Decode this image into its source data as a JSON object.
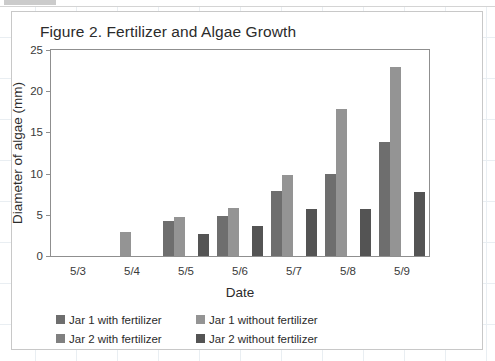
{
  "chart_data": {
    "type": "bar",
    "title": "Figure 2. Fertilizer and Algae Growth",
    "xlabel": "Date",
    "ylabel": "Diameter of algae (mm)",
    "categories": [
      "5/3",
      "5/4",
      "5/5",
      "5/6",
      "5/7",
      "5/8",
      "5/9"
    ],
    "ylim": [
      0,
      25
    ],
    "yticks": [
      0,
      5,
      10,
      15,
      20,
      25
    ],
    "grid": false,
    "legend_position": "bottom-left",
    "series": [
      {
        "name": "Jar 1 with fertilizer",
        "color": "#6e6e6e",
        "values": [
          0,
          0,
          4.3,
          4.8,
          7.9,
          9.9,
          13.8
        ]
      },
      {
        "name": "Jar 1 without fertilizer",
        "color": "#949494",
        "values": [
          0,
          2.9,
          4.7,
          5.8,
          9.8,
          17.8,
          22.9
        ]
      },
      {
        "name": "Jar 2 with fertilizer",
        "color": "#808080",
        "values": [
          0,
          0,
          0,
          0,
          0,
          0,
          0
        ]
      },
      {
        "name": "Jar 2 without fertilizer",
        "color": "#545454",
        "values": [
          0,
          0,
          2.7,
          3.7,
          5.7,
          5.7,
          7.8
        ]
      }
    ]
  },
  "figure": {
    "axis_color": "#8f8f8f",
    "card_border_color": "#c8c8c8",
    "page_grid_color": "#e9eef2"
  }
}
